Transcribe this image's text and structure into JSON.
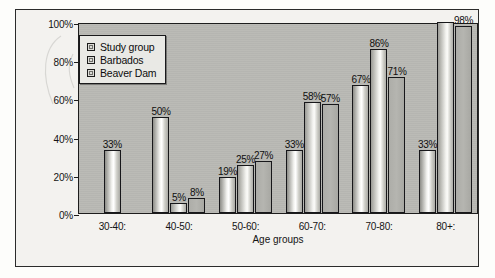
{
  "chart_data": {
    "type": "bar",
    "title": "",
    "xlabel": "Age groups",
    "ylabel": "",
    "ylim": [
      0,
      100
    ],
    "yticks": [
      "0%",
      "20%",
      "40%",
      "60%",
      "80%",
      "100%"
    ],
    "ytick_values": [
      0,
      20,
      40,
      60,
      80,
      100
    ],
    "grid": false,
    "legend_position": "top-left",
    "categories": [
      "30-40:",
      "40-50:",
      "50-60:",
      "60-70:",
      "70-80:",
      "80+:"
    ],
    "series": [
      {
        "name": "Study group",
        "values": [
          33,
          50,
          19,
          33,
          67,
          33
        ],
        "labels": [
          "33%",
          "50%",
          "19%",
          "33%",
          "67%",
          "33%"
        ]
      },
      {
        "name": "Barbados",
        "values": [
          null,
          5,
          25,
          58,
          86,
          100
        ],
        "labels": [
          "",
          "5%",
          "25%",
          "58%",
          "86%",
          ""
        ]
      },
      {
        "name": "Beaver Dam",
        "values": [
          null,
          8,
          27,
          57,
          71,
          98
        ],
        "labels": [
          "",
          "8%",
          "27%",
          "57%",
          "71%",
          "98%"
        ]
      }
    ]
  },
  "legend": {
    "items": [
      {
        "label": "Study group",
        "swatch": "legend-swatch-study-group"
      },
      {
        "label": "Barbados",
        "swatch": "legend-swatch-barbados"
      },
      {
        "label": "Beaver Dam",
        "swatch": "legend-swatch-beaver-dam"
      }
    ]
  },
  "colors": {
    "plot_background": "#b9b9b4",
    "figure_background": "#f3f2ef",
    "axis_line": "#1d1d1d",
    "bar_outline": "#17171a",
    "text": "#141414"
  }
}
